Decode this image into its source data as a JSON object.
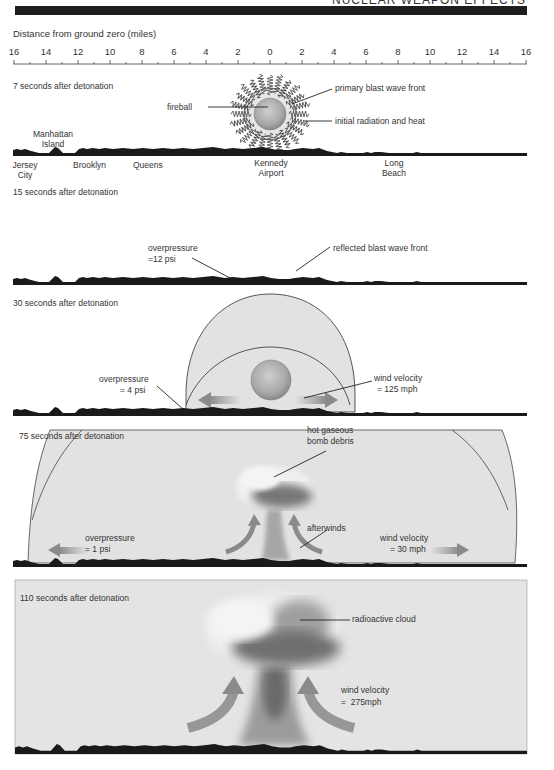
{
  "header": {
    "title": "NUCLEAR WEAPON EFFECTS"
  },
  "axis": {
    "title": "Distance from ground zero (miles)",
    "tick_labels": [
      "16",
      "14",
      "12",
      "10",
      "8",
      "6",
      "4",
      "2",
      "0",
      "2",
      "4",
      "6",
      "8",
      "10",
      "12",
      "14",
      "16"
    ]
  },
  "panels": [
    {
      "title": "7 seconds after detonation",
      "labels": {
        "fireball": "fireball",
        "primary_blast": "primary blast wave front",
        "initial_radiation": "initial radiation and heat"
      },
      "places": [
        {
          "line1": "Manhattan",
          "line2": "Island"
        },
        {
          "line1": "Jersey",
          "line2": "City"
        },
        {
          "line1": "Brooklyn",
          "line2": ""
        },
        {
          "line1": "Queens",
          "line2": ""
        },
        {
          "line1": "Kennedy",
          "line2": "Airport"
        },
        {
          "line1": "Long",
          "line2": "Beach"
        }
      ]
    },
    {
      "title": "15 seconds after detonation",
      "labels": {
        "overpressure_1": "overpressure",
        "overpressure_2": "=12 psi",
        "reflected": "reflected blast wave front"
      }
    },
    {
      "title": "30 seconds after detonation",
      "labels": {
        "overpressure_1": "overpressure",
        "overpressure_2": "= 4 psi",
        "wind_1": "wind velocity",
        "wind_2": "= 125 mph"
      }
    },
    {
      "title": "75 seconds after detonation",
      "labels": {
        "debris_1": "hot gaseous",
        "debris_2": "bomb debris",
        "afterwinds": "afterwinds",
        "overpressure_1": "overpressure",
        "overpressure_2": "= 1 psi",
        "wind_1": "wind velocity",
        "wind_2": "= 30 mph"
      }
    },
    {
      "title": "110 seconds after detonation",
      "labels": {
        "cloud": "radioactive cloud",
        "wind_1": "wind velocity",
        "wind_2": "=  275mph"
      }
    }
  ],
  "colors": {
    "ground": "#1a1a1a",
    "shock_fill": "#e2e2e2",
    "panel_fill": "#e4e4e4",
    "fireball": "#b8b8b8",
    "arrow": "#8a8a8a",
    "cloud_dark": "#5a5a5a",
    "cloud_light": "#efefef"
  }
}
